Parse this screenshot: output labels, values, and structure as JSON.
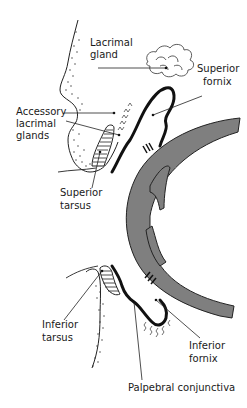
{
  "figure": {
    "type": "anatomical-diagram"
  },
  "labels": {
    "lacrimal_gland": [
      "Lacrimal",
      "gland"
    ],
    "superior_fornix": [
      "Superior",
      "fornix"
    ],
    "accessory_lacrimal_glands": [
      "Accessory",
      "lacrimal",
      "glands"
    ],
    "superior_tarsus": [
      "Superior",
      "tarsus"
    ],
    "inferior_tarsus": [
      "Inferior",
      "tarsus"
    ],
    "inferior_fornix": [
      "Inferior",
      "fornix"
    ],
    "palpebral_conjunctiva": "Palpebral conjunctiva"
  },
  "colors": {
    "globe": "#7f7f7f",
    "ink": "#1a1a1a",
    "background": "#ffffff"
  }
}
